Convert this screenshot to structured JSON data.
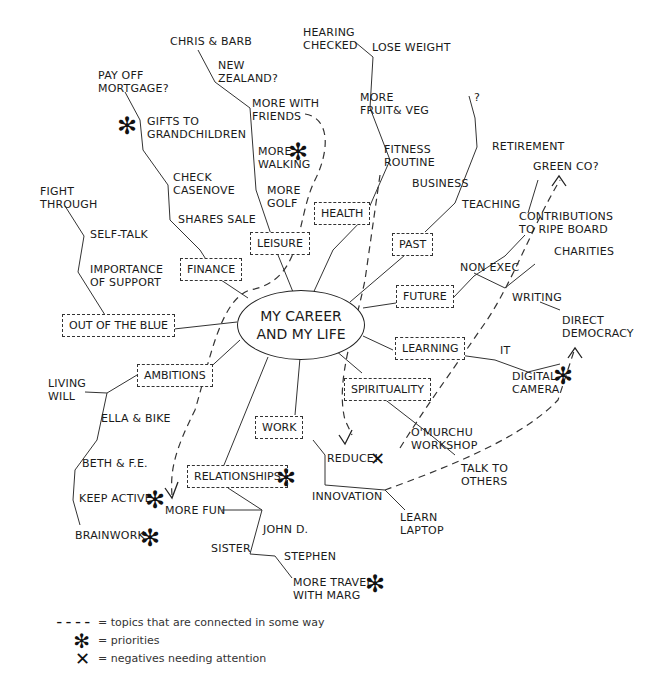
{
  "diagram": {
    "type": "mind-map",
    "center": "MY CAREER\nAND MY LIFE",
    "branches": [
      {
        "label": "HEALTH",
        "items": [
          "FITNESS\nROUTINE",
          "MORE\nFRUIT& VEG",
          "LOSE WEIGHT",
          "HEARING\nCHECKED"
        ]
      },
      {
        "label": "LEISURE",
        "items": [
          "MORE\nGOLF",
          "MORE\nWALKING",
          "MORE WITH\nFRIENDS",
          "NEW\nZEALAND?",
          "CHRIS & BARB"
        ]
      },
      {
        "label": "FINANCE",
        "items": [
          "SHARES SALE",
          "CHECK\nCASENOVE",
          "GIFTS TO\nGRANDCHILDREN",
          "PAY OFF\nMORTGAGE?"
        ]
      },
      {
        "label": "OUT OF THE BLUE",
        "items": [
          "IMPORTANCE\nOF SUPPORT",
          "SELF-TALK",
          "FIGHT\nTHROUGH"
        ]
      },
      {
        "label": "AMBITIONS",
        "items": [
          "LIVING\nWILL",
          "ELLA & BIKE",
          "BETH & F.E.",
          "KEEP ACTIVE",
          "BRAINWORK"
        ]
      },
      {
        "label": "RELATIONSHIPS",
        "items": [
          "MORE FUN",
          "JOHN D.",
          "SISTER",
          "STEPHEN",
          "MORE TRAVEL\nWITH MARG"
        ]
      },
      {
        "label": "WORK",
        "items": [
          "REDUCE!",
          "INNOVATION",
          "LEARN\nLAPTOP"
        ]
      },
      {
        "label": "SPIRITUALITY",
        "items": [
          "O'MURCHU\nWORKSHOP",
          "TALK TO\nOTHERS"
        ]
      },
      {
        "label": "LEARNING",
        "items": [
          "IT",
          "DIGITAL\nCAMERA"
        ]
      },
      {
        "label": "FUTURE",
        "items": [
          "NON EXEC",
          "CONTRIBUTIONS\nTO RIPE BOARD",
          "GREEN CO?",
          "CHARITIES",
          "WRITING",
          "DIRECT\nDEMOCRACY"
        ]
      },
      {
        "label": "PAST",
        "items": [
          "TEACHING",
          "BUSINESS",
          "RETIREMENT",
          "?"
        ]
      }
    ],
    "priorities": [
      "MORE WALKING",
      "GIFTS TO GRANDCHILDREN",
      "KEEP ACTIVE",
      "BRAINWORK",
      "RELATIONSHIPS",
      "MORE TRAVEL WITH MARG",
      "DIGITAL CAMERA"
    ],
    "negatives": [
      "REDUCE!"
    ]
  },
  "labels": {
    "chris_barb": "CHRIS & BARB",
    "new_zealand": "NEW\nZEALAND?",
    "pay_off_mortgage": "PAY OFF\nMORTGAGE?",
    "gifts_grandchildren": "GIFTS TO\nGRANDCHILDREN",
    "more_with_friends": "MORE WITH\nFRIENDS",
    "hearing_checked": "HEARING\nCHECKED",
    "lose_weight": "LOSE WEIGHT",
    "more_fruit_veg": "MORE\nFRUIT& VEG",
    "more_walking": "MORE\nWALKING",
    "check_casenove": "CHECK\nCASENOVE",
    "fight_through": "FIGHT\nTHROUGH",
    "more_golf": "MORE\nGOLF",
    "fitness_routine": "FITNESS\nROUTINE",
    "question": "?",
    "retirement": "RETIREMENT",
    "green_co": "GREEN CO?",
    "business": "BUSINESS",
    "shares_sale": "SHARES SALE",
    "self_talk": "SELF-TALK",
    "teaching": "TEACHING",
    "contributions": "CONTRIBUTIONS\nTO RIPE BOARD",
    "importance_support": "IMPORTANCE\nOF SUPPORT",
    "charities": "CHARITIES",
    "non_exec": "NON EXEC",
    "writing": "WRITING",
    "direct_democracy": "DIRECT\nDEMOCRACY",
    "it": "IT",
    "digital_camera": "DIGITAL\nCAMERA",
    "living_will": "LIVING\nWILL",
    "ella_bike": "ELLA & BIKE",
    "omurchu": "O'MURCHU\nWORKSHOP",
    "reduce": "REDUCE!",
    "talk_others": "TALK TO\nOTHERS",
    "beth_fe": "BETH & F.E.",
    "innovation": "INNOVATION",
    "keep_active": "KEEP ACTIVE",
    "more_fun": "MORE FUN",
    "learn_laptop": "LEARN\nLAPTOP",
    "john_d": "JOHN D.",
    "brainwork": "BRAINWORK",
    "sister": "SISTER",
    "stephen": "STEPHEN",
    "more_travel": "MORE TRAVEL\nWITH MARG"
  },
  "boxes": {
    "health": "HEALTH",
    "leisure": "LEISURE",
    "finance": "FINANCE",
    "past": "PAST",
    "future": "FUTURE",
    "out_of_blue": "OUT OF THE BLUE",
    "learning": "LEARNING",
    "ambitions": "AMBITIONS",
    "spirituality": "SPIRITUALITY",
    "work": "WORK",
    "relationships": "RELATIONSHIPS"
  },
  "center": {
    "title": "MY CAREER\nAND MY LIFE"
  },
  "symbols": {
    "priority": "✻",
    "negative": "✕",
    "dash": "– – – –"
  },
  "legend": {
    "items": [
      {
        "symbol": "– – – –",
        "text": "= topics that are connected in some way"
      },
      {
        "symbol": "✻",
        "text": "= priorities"
      },
      {
        "symbol": "✕",
        "text": "= negatives needing attention"
      }
    ]
  }
}
